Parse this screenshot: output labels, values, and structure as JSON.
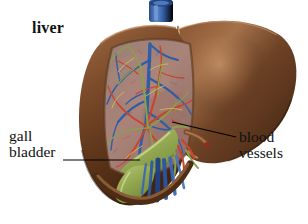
{
  "figure": {
    "background_color": "#ffffff"
  },
  "labels": {
    "liver": "liver",
    "gall_line1": "gall",
    "gall_line2": "bladder",
    "blood_line1": "blood",
    "blood_line2": "vessels"
  },
  "leader_lines": {
    "gall_bladder": "line from bladder text to gallbladder sac",
    "blood_vessels": "line from blood vessels text to hilum vessels"
  },
  "anatomy": {
    "right_lobe": "right lobe of liver",
    "left_lobe": "left lobe of liver, cut open",
    "cut_surface": "cut surface showing internal vasculature",
    "gallbladder": "gallbladder",
    "vena_cava": "inferior vena cava",
    "falciform_ligament": "falciform ligament",
    "hepatic_veins": "hepatic veins",
    "hepatic_arteries": "hepatic arteries",
    "bile_ducts": "bile ducts"
  },
  "colors": {
    "liver_brown": "#6b4024",
    "liver_brown_light": "#a9714a",
    "liver_brown_dark": "#3c2112",
    "cut_surface": "#9e7a6e",
    "vein_blue": "#2f5fa8",
    "vein_blue_dark": "#16407f",
    "artery_red": "#c8452f",
    "bile_green": "#8aa04a",
    "gallbladder_green": "#9bb25c",
    "label_text": "#111111",
    "leader_line": "#000000"
  }
}
